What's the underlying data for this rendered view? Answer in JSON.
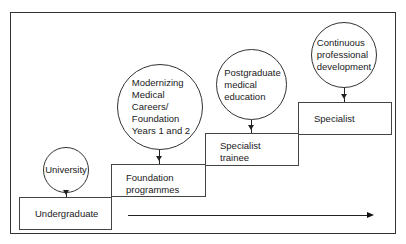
{
  "diagram": {
    "type": "staircase-flow",
    "stages": [
      {
        "id": "undergraduate",
        "label": "Undergraduate"
      },
      {
        "id": "foundation",
        "label_lines": [
          "Foundation",
          "programmes"
        ]
      },
      {
        "id": "specialist-trainee",
        "label_lines": [
          "Specialist",
          "trainee"
        ]
      },
      {
        "id": "specialist",
        "label": "Specialist"
      }
    ],
    "providers": [
      {
        "id": "university",
        "label_lines": [
          "University"
        ]
      },
      {
        "id": "mmc",
        "label_lines": [
          "Modernizing",
          "Medical",
          "Careers/",
          "Foundation",
          "Years 1 and 2"
        ]
      },
      {
        "id": "pgme",
        "label_lines": [
          "Postgraduate",
          "medical",
          "education"
        ]
      },
      {
        "id": "cpd",
        "label_lines": [
          "Continuous",
          "professional",
          "development"
        ]
      }
    ],
    "timeline_arrow": "progression"
  }
}
